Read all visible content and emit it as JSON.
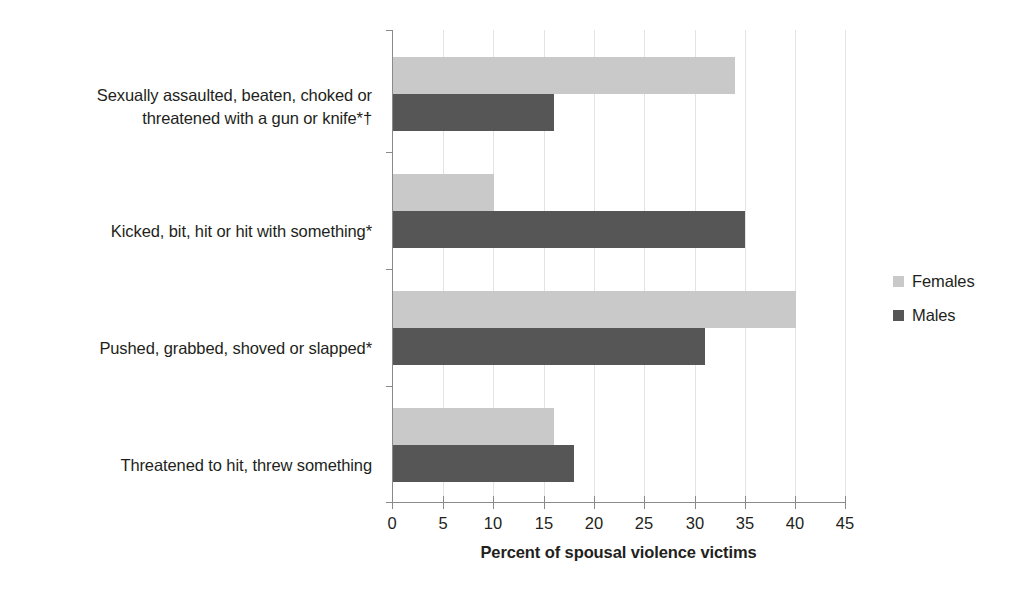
{
  "chart_data": {
    "type": "bar",
    "orientation": "horizontal",
    "title": "",
    "xlabel": "Percent of spousal violence victims",
    "ylabel": "",
    "xlim": [
      0,
      45
    ],
    "xticks": [
      "0",
      "5",
      "10",
      "15",
      "20",
      "25",
      "30",
      "35",
      "40",
      "45"
    ],
    "grid": "vertical",
    "legend_position": "right",
    "categories": [
      "Sexually assaulted, beaten, choked or threatened with a gun or knife*†",
      "Kicked, bit, hit or hit with something*",
      "Pushed, grabbed, shoved or slapped*",
      "Threatened to hit, threw something"
    ],
    "category_lines": [
      [
        "Sexually assaulted, beaten, choked or",
        "threatened with a gun or knife*†"
      ],
      [
        "Kicked, bit, hit or hit with something*"
      ],
      [
        "Pushed, grabbed, shoved or slapped*"
      ],
      [
        "Threatened to hit, threw something"
      ]
    ],
    "series": [
      {
        "name": "Females",
        "color": "#c9c9c9",
        "values": [
          34,
          10,
          40,
          16
        ]
      },
      {
        "name": "Males",
        "color": "#565656",
        "values": [
          16,
          35,
          31,
          18
        ]
      }
    ]
  },
  "legend": {
    "items": [
      {
        "label": "Females"
      },
      {
        "label": "Males"
      }
    ]
  },
  "colors": {
    "females": "#c9c9c9",
    "males": "#565656",
    "axis": "#8a8a8a",
    "gridline": "#e3e3e3",
    "text": "#231f20",
    "background": "#ffffff"
  }
}
